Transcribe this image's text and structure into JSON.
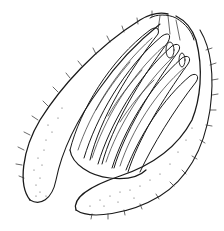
{
  "figure": {
    "kind": "scientific line drawing",
    "style": "black ink on white, stippling and hatching",
    "colors": {
      "ink": "#1a1a1a",
      "background": "#ffffff"
    }
  }
}
